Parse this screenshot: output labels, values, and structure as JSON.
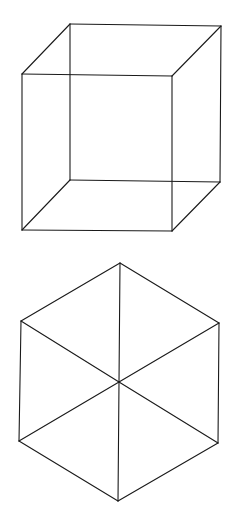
{
  "canvas": {
    "width": 234,
    "height": 529,
    "background": "#ffffff",
    "stroke_color": "#1a1a1a"
  },
  "figures": [
    {
      "name": "necker-cube",
      "type": "wireframe-cube",
      "vertices": {
        "front_top_left": [
          22,
          74
        ],
        "front_top_right": [
          172,
          76
        ],
        "front_bottom_left": [
          22,
          230
        ],
        "front_bottom_right": [
          172,
          231
        ],
        "back_top_left": [
          70,
          24
        ],
        "back_top_right": [
          221,
          26
        ],
        "back_bottom_left": [
          70,
          180
        ],
        "back_bottom_right": [
          220,
          182
        ]
      },
      "edges": [
        [
          "front_top_left",
          "front_top_right"
        ],
        [
          "front_top_right",
          "front_bottom_right"
        ],
        [
          "front_bottom_right",
          "front_bottom_left"
        ],
        [
          "front_bottom_left",
          "front_top_left"
        ],
        [
          "back_top_left",
          "back_top_right"
        ],
        [
          "back_top_right",
          "back_bottom_right"
        ],
        [
          "back_bottom_right",
          "back_bottom_left"
        ],
        [
          "back_bottom_left",
          "back_top_left"
        ],
        [
          "front_top_left",
          "back_top_left"
        ],
        [
          "front_top_right",
          "back_top_right"
        ],
        [
          "front_bottom_left",
          "back_bottom_left"
        ],
        [
          "front_bottom_right",
          "back_bottom_right"
        ]
      ]
    },
    {
      "name": "hexagon-cube",
      "type": "isometric-cube-hexagon",
      "vertices": {
        "top": [
          120,
          263
        ],
        "upper_left": [
          21,
          321
        ],
        "upper_right": [
          219,
          323
        ],
        "center": [
          119,
          382
        ],
        "lower_left": [
          19,
          441
        ],
        "lower_right": [
          218,
          443
        ],
        "bottom": [
          118,
          501
        ]
      },
      "edges": [
        [
          "top",
          "upper_right"
        ],
        [
          "upper_right",
          "lower_right"
        ],
        [
          "lower_right",
          "bottom"
        ],
        [
          "bottom",
          "lower_left"
        ],
        [
          "lower_left",
          "upper_left"
        ],
        [
          "upper_left",
          "top"
        ],
        [
          "top",
          "center"
        ],
        [
          "center",
          "bottom"
        ],
        [
          "upper_left",
          "center"
        ],
        [
          "center",
          "lower_right"
        ],
        [
          "upper_right",
          "center"
        ],
        [
          "center",
          "lower_left"
        ]
      ]
    }
  ]
}
